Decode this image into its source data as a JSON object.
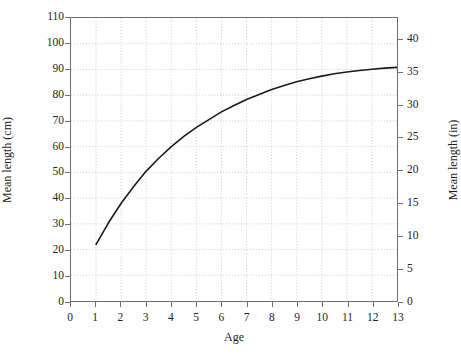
{
  "chart_data": {
    "type": "line",
    "title": "",
    "subtitle": "",
    "xlabel": "Age",
    "ylabel": "Mean length (cm)",
    "ylabel_secondary": "Mean length (in)",
    "xlim": [
      0,
      13
    ],
    "ylim": [
      0,
      110
    ],
    "ylim_secondary": [
      0,
      43.3
    ],
    "xticks": [
      0,
      1,
      2,
      3,
      4,
      5,
      6,
      7,
      8,
      9,
      10,
      11,
      12,
      13
    ],
    "xticklabels": [
      "0",
      "1",
      "2",
      "3",
      "4",
      "5",
      "6",
      "7",
      "8",
      "9",
      "10",
      "11",
      "12",
      "13"
    ],
    "yticks": [
      0,
      10,
      20,
      30,
      40,
      50,
      60,
      70,
      80,
      90,
      100,
      110
    ],
    "yticklabels": [
      "0",
      "10",
      "20",
      "30",
      "40",
      "50",
      "60",
      "70",
      "80",
      "90",
      "100",
      "110"
    ],
    "yticks_secondary": [
      0,
      5,
      10,
      15,
      20,
      25,
      30,
      35,
      40
    ],
    "yticklabels_secondary": [
      "0",
      "5",
      "10",
      "15",
      "20",
      "25",
      "30",
      "35",
      "40"
    ],
    "grid": true,
    "grid_style": "dotted",
    "grid_color": "#cccccc",
    "legend": false,
    "legend_position": "none",
    "line_color": "#1a1a1a",
    "line_width": 1.6,
    "series": [
      {
        "name": "Mean length",
        "x": [
          1,
          1.5,
          2,
          2.5,
          3,
          3.5,
          4,
          4.5,
          5,
          5.5,
          6,
          6.5,
          7,
          7.5,
          8,
          8.5,
          9,
          9.5,
          10,
          10.5,
          11,
          11.5,
          12,
          12.5,
          13
        ],
        "values": [
          22.0,
          30.5,
          38.0,
          44.5,
          50.5,
          55.5,
          60.0,
          64.0,
          67.5,
          70.5,
          73.5,
          76.0,
          78.3,
          80.3,
          82.2,
          83.8,
          85.2,
          86.4,
          87.4,
          88.3,
          89.0,
          89.6,
          90.1,
          90.5,
          90.8
        ]
      }
    ]
  },
  "axes": {
    "x_title": "Age",
    "y_title_left": "Mean length (cm)",
    "y_title_right": "Mean length (in)"
  }
}
